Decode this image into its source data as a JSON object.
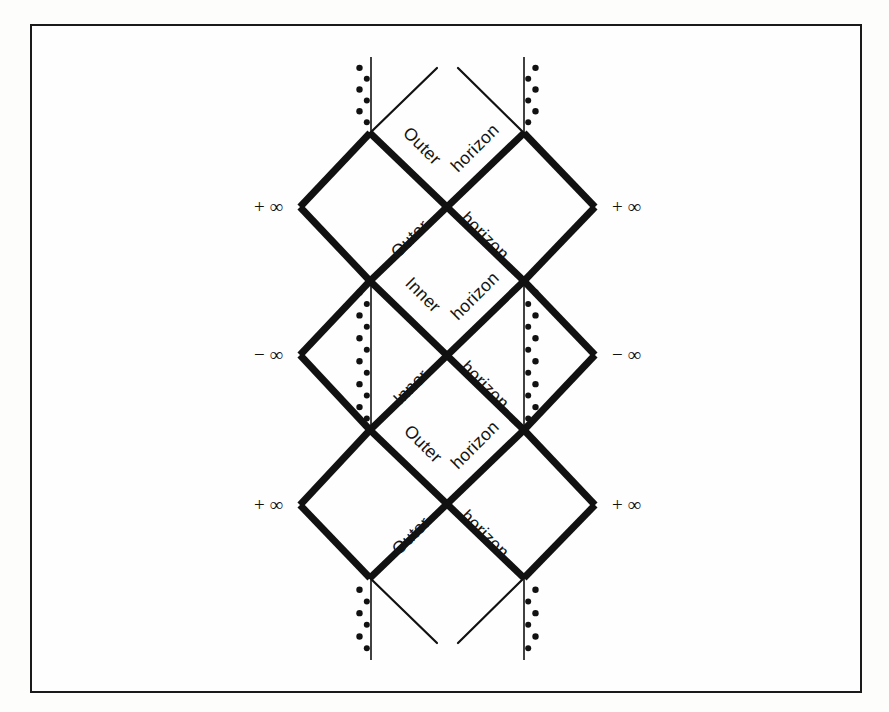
{
  "figure": {
    "frame": {
      "stroke_color": "#1a1a1a",
      "background": "#fefefe"
    },
    "geometry": {
      "left_x": 300,
      "right_x": 595,
      "inner_left_x": 370,
      "inner_right_x": 524,
      "rows_y": [
        133,
        207,
        281,
        355,
        430,
        505,
        578
      ],
      "top_tip_y": 57,
      "bottom_tip_y": 660,
      "thick_stroke": 7,
      "thin_stroke": 2.2,
      "stroke_color": "#111111"
    }
  },
  "labels": {
    "outer": "Outer",
    "inner": "Inner",
    "horizon": "horizon",
    "plus_infinity": "+ ∞",
    "minus_infinity": "− ∞"
  },
  "horizon_labels": [
    {
      "name": "outer-horizon-top-left",
      "text": "Outer",
      "x": 418,
      "y": 150,
      "rotate": 45
    },
    {
      "name": "outer-horizon-top-right",
      "text": "horizon",
      "x": 479,
      "y": 152,
      "rotate": -45
    },
    {
      "name": "outer-horizon-upper-left",
      "text": "Outer",
      "x": 414,
      "y": 243,
      "rotate": -45
    },
    {
      "name": "outer-horizon-upper-right",
      "text": "horizon",
      "x": 481,
      "y": 240,
      "rotate": 45
    },
    {
      "name": "inner-horizon-upper-left",
      "text": "Inner",
      "x": 419,
      "y": 299,
      "rotate": 45
    },
    {
      "name": "inner-horizon-upper-right",
      "text": "horizon",
      "x": 479,
      "y": 300,
      "rotate": -45
    },
    {
      "name": "inner-horizon-lower-left",
      "text": "Inner",
      "x": 415,
      "y": 391,
      "rotate": -45
    },
    {
      "name": "inner-horizon-lower-right",
      "text": "horizon",
      "x": 481,
      "y": 389,
      "rotate": 45
    },
    {
      "name": "outer-horizon-lower-left",
      "text": "Outer",
      "x": 419,
      "y": 448,
      "rotate": 45
    },
    {
      "name": "outer-horizon-lower-right",
      "text": "horizon",
      "x": 479,
      "y": 449,
      "rotate": -45
    },
    {
      "name": "outer-horizon-bottom-left",
      "text": "Outer",
      "x": 415,
      "y": 540,
      "rotate": -45
    },
    {
      "name": "outer-horizon-bottom-right",
      "text": "horizon",
      "x": 481,
      "y": 538,
      "rotate": 45
    }
  ],
  "infinity_labels": [
    {
      "name": "infinity-left-upper",
      "text": "+ ∞",
      "x": 283,
      "y": 213,
      "anchor": "end"
    },
    {
      "name": "infinity-right-upper",
      "text": "+ ∞",
      "x": 612,
      "y": 213,
      "anchor": "start"
    },
    {
      "name": "infinity-left-middle",
      "text": "− ∞",
      "x": 283,
      "y": 361,
      "anchor": "end"
    },
    {
      "name": "infinity-right-middle",
      "text": "− ∞",
      "x": 612,
      "y": 361,
      "anchor": "start"
    },
    {
      "name": "infinity-left-lower",
      "text": "+ ∞",
      "x": 283,
      "y": 511,
      "anchor": "end"
    },
    {
      "name": "infinity-right-lower",
      "text": "+ ∞",
      "x": 612,
      "y": 511,
      "anchor": "start"
    }
  ],
  "thick_edges": [
    {
      "name": "edge-upper-block-nw",
      "x1": 370,
      "y1": 133,
      "x2": 300,
      "y2": 207
    },
    {
      "name": "edge-upper-block-sw",
      "x1": 300,
      "y1": 207,
      "x2": 370,
      "y2": 281
    },
    {
      "name": "edge-upper-block-ne",
      "x1": 524,
      "y1": 133,
      "x2": 595,
      "y2": 207
    },
    {
      "name": "edge-upper-block-se",
      "x1": 595,
      "y1": 207,
      "x2": 524,
      "y2": 281
    },
    {
      "name": "edge-upper-inner-w",
      "x1": 370,
      "y1": 133,
      "x2": 524,
      "y2": 281
    },
    {
      "name": "edge-upper-inner-e",
      "x1": 524,
      "y1": 133,
      "x2": 370,
      "y2": 281
    },
    {
      "name": "edge-mid-block-nw",
      "x1": 370,
      "y1": 281,
      "x2": 300,
      "y2": 355
    },
    {
      "name": "edge-mid-block-sw",
      "x1": 300,
      "y1": 355,
      "x2": 370,
      "y2": 430
    },
    {
      "name": "edge-mid-block-ne",
      "x1": 524,
      "y1": 281,
      "x2": 595,
      "y2": 355
    },
    {
      "name": "edge-mid-block-se",
      "x1": 595,
      "y1": 355,
      "x2": 524,
      "y2": 430
    },
    {
      "name": "edge-mid-inner-w",
      "x1": 370,
      "y1": 281,
      "x2": 524,
      "y2": 430
    },
    {
      "name": "edge-mid-inner-e",
      "x1": 524,
      "y1": 281,
      "x2": 370,
      "y2": 430
    },
    {
      "name": "edge-lower-block-nw",
      "x1": 370,
      "y1": 430,
      "x2": 300,
      "y2": 505
    },
    {
      "name": "edge-lower-block-sw",
      "x1": 300,
      "y1": 505,
      "x2": 370,
      "y2": 578
    },
    {
      "name": "edge-lower-block-ne",
      "x1": 524,
      "y1": 430,
      "x2": 595,
      "y2": 505
    },
    {
      "name": "edge-lower-block-se",
      "x1": 595,
      "y1": 505,
      "x2": 524,
      "y2": 578
    },
    {
      "name": "edge-lower-inner-w",
      "x1": 370,
      "y1": 430,
      "x2": 524,
      "y2": 578
    },
    {
      "name": "edge-lower-inner-e",
      "x1": 524,
      "y1": 430,
      "x2": 370,
      "y2": 578
    }
  ],
  "thin_edges": [
    {
      "name": "null-ray-top-left",
      "x1": 370,
      "y1": 133,
      "x2": 437,
      "y2": 68
    },
    {
      "name": "null-ray-top-right",
      "x1": 524,
      "y1": 133,
      "x2": 458,
      "y2": 68
    },
    {
      "name": "null-ray-bottom-left",
      "x1": 370,
      "y1": 578,
      "x2": 437,
      "y2": 643
    },
    {
      "name": "null-ray-bottom-right",
      "x1": 524,
      "y1": 578,
      "x2": 458,
      "y2": 643
    },
    {
      "name": "horizon-line-upper-w",
      "x1": 370,
      "y1": 133,
      "x2": 524,
      "y2": 281
    },
    {
      "name": "horizon-line-upper-e",
      "x1": 524,
      "y1": 133,
      "x2": 370,
      "y2": 281
    },
    {
      "name": "horizon-line-mid-w",
      "x1": 370,
      "y1": 281,
      "x2": 524,
      "y2": 430
    },
    {
      "name": "horizon-line-mid-e",
      "x1": 524,
      "y1": 281,
      "x2": 370,
      "y2": 430
    },
    {
      "name": "horizon-line-lower-w",
      "x1": 370,
      "y1": 430,
      "x2": 524,
      "y2": 578
    },
    {
      "name": "horizon-line-lower-e",
      "x1": 524,
      "y1": 430,
      "x2": 370,
      "y2": 578
    }
  ],
  "singularities": [
    {
      "name": "singularity-top-left",
      "x": 371,
      "y1": 57,
      "y2": 133,
      "dot_side": "left"
    },
    {
      "name": "singularity-top-right",
      "x": 524,
      "y1": 57,
      "y2": 133,
      "dot_side": "right"
    },
    {
      "name": "singularity-middle-left",
      "x": 371,
      "y1": 281,
      "y2": 430,
      "dot_side": "left"
    },
    {
      "name": "singularity-middle-right",
      "x": 524,
      "y1": 281,
      "y2": 430,
      "dot_side": "right"
    },
    {
      "name": "singularity-bottom-left",
      "x": 371,
      "y1": 578,
      "y2": 660,
      "dot_side": "left"
    },
    {
      "name": "singularity-bottom-right",
      "x": 524,
      "y1": 578,
      "y2": 660,
      "dot_side": "right"
    }
  ]
}
